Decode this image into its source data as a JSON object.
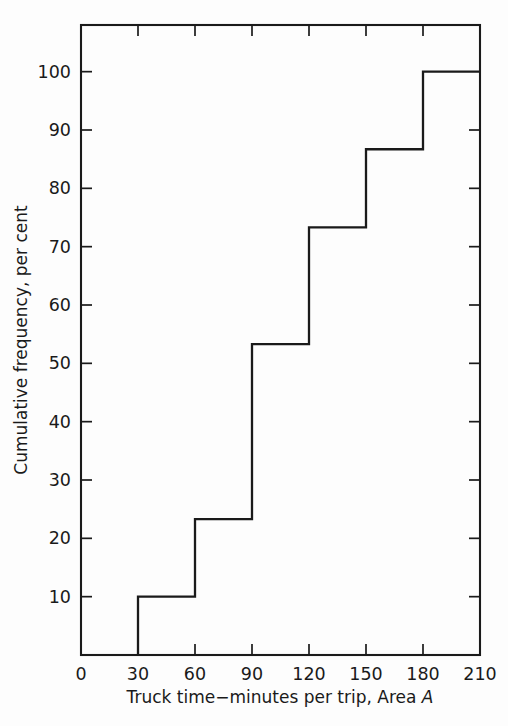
{
  "chart_data": {
    "type": "line",
    "subtype": "step-ogive",
    "title": "",
    "xlabel": "Truck time−minutes per trip, Area A",
    "xlabel_plain": "Truck time−minutes per trip, Area ",
    "xlabel_italic": "A",
    "ylabel": "Cumulative frequency, per cent",
    "xlim": [
      0,
      210
    ],
    "ylim": [
      0,
      108
    ],
    "grid": false,
    "legend": null,
    "x_ticks": [
      0,
      30,
      60,
      90,
      120,
      150,
      180,
      210
    ],
    "x_tick_labels": [
      "0",
      "30",
      "60",
      "90",
      "120",
      "150",
      "180",
      "210"
    ],
    "y_ticks": [
      10,
      20,
      30,
      40,
      50,
      60,
      70,
      80,
      90,
      100
    ],
    "y_tick_labels": [
      "10",
      "20",
      "30",
      "40",
      "50",
      "60",
      "70",
      "80",
      "90",
      "100"
    ],
    "bin_edges": [
      30,
      60,
      90,
      120,
      150,
      180,
      210
    ],
    "cumulative_values": [
      10.0,
      23.3,
      53.3,
      73.3,
      86.7,
      100.0
    ],
    "step_points": [
      {
        "x": 30,
        "y": 0
      },
      {
        "x": 30,
        "y": 10.0
      },
      {
        "x": 60,
        "y": 10.0
      },
      {
        "x": 60,
        "y": 23.3
      },
      {
        "x": 90,
        "y": 23.3
      },
      {
        "x": 90,
        "y": 53.3
      },
      {
        "x": 120,
        "y": 53.3
      },
      {
        "x": 120,
        "y": 73.3
      },
      {
        "x": 150,
        "y": 73.3
      },
      {
        "x": 150,
        "y": 86.7
      },
      {
        "x": 180,
        "y": 86.7
      },
      {
        "x": 180,
        "y": 100.0
      },
      {
        "x": 210,
        "y": 100.0
      }
    ],
    "line_color": "#1a1a1a",
    "axis_color": "#1a1a1a",
    "background_color": "#fdfdfd",
    "tick_direction": "in",
    "frame": "box"
  }
}
